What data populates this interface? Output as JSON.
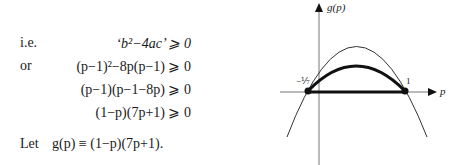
{
  "derivation": {
    "rows": [
      {
        "prefix": "i.e.",
        "expr": "‘b²−4ac’ ⩾ 0"
      },
      {
        "prefix": "or",
        "expr": "(p−1)²−8p(p−1) ⩾ 0"
      },
      {
        "prefix": "",
        "expr": "(p−1)(p−1−8p) ⩾ 0"
      },
      {
        "prefix": "",
        "expr": "(1−p)(7p+1) ⩾ 0"
      }
    ],
    "definition": {
      "prefix": "Let",
      "expr": "g(p) ≡ (1−p)(7p+1)."
    }
  },
  "graph": {
    "y_axis_label": "g(p)",
    "x_axis_label": "p",
    "left_root_label": "−⅐",
    "right_root_label": "1",
    "function": "g(p) = (1−p)(7p+1)",
    "highlighted_interval": "[−1/7, 1]"
  }
}
